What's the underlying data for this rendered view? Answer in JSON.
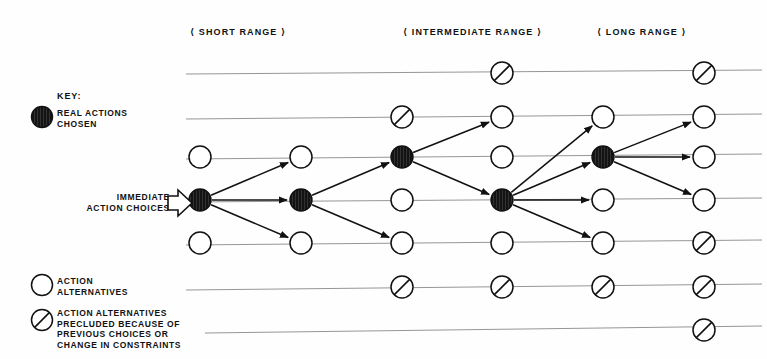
{
  "diagram": {
    "headers": [
      {
        "label": "SHORT RANGE",
        "x": 255,
        "y": 27
      },
      {
        "label": "INTERMEDIATE RANGE",
        "x": 465,
        "y": 27
      },
      {
        "label": "LONG RANGE",
        "x": 650,
        "y": 27
      }
    ],
    "key": {
      "title": "KEY:",
      "entries": [
        {
          "symbol": "filled-node",
          "text": "REAL ACTIONS\nCHOSEN"
        },
        {
          "symbol": "open-node",
          "text": "ACTION\nALTERNATIVES"
        },
        {
          "symbol": "precluded-node",
          "text": "ACTION ALTERNATIVES\nPRECLUDED BECAUSE OF\nPREVIOUS CHOICES OR\nCHANGE IN CONSTRAINTS"
        }
      ]
    },
    "immediate_label": "IMMEDIATE\nACTION CHOICES",
    "colors": {
      "ink": "#111111",
      "rule": "#8a8a8a",
      "paper": "#fefefe"
    },
    "columns": [
      200,
      301,
      402,
      502,
      603,
      704
    ],
    "rows": [
      73,
      117,
      157,
      200,
      243,
      287,
      330
    ],
    "rules": [
      {
        "x1": 186,
        "y1": 74,
        "x2": 762,
        "y2": 70
      },
      {
        "x1": 186,
        "y1": 119,
        "x2": 762,
        "y2": 114
      },
      {
        "x1": 186,
        "y1": 159,
        "x2": 762,
        "y2": 154
      },
      {
        "x1": 186,
        "y1": 202,
        "x2": 762,
        "y2": 198
      },
      {
        "x1": 186,
        "y1": 245,
        "x2": 762,
        "y2": 240
      },
      {
        "x1": 186,
        "y1": 290,
        "x2": 762,
        "y2": 284
      },
      {
        "x1": 205,
        "y1": 333,
        "x2": 762,
        "y2": 326
      }
    ],
    "nodes": [
      {
        "id": "c4r1",
        "col": 4,
        "row": 1,
        "type": "precluded"
      },
      {
        "id": "c6r1",
        "col": 6,
        "row": 1,
        "type": "precluded"
      },
      {
        "id": "c3r2",
        "col": 3,
        "row": 2,
        "type": "precluded"
      },
      {
        "id": "c4r2",
        "col": 4,
        "row": 2,
        "type": "open"
      },
      {
        "id": "c5r2",
        "col": 5,
        "row": 2,
        "type": "open"
      },
      {
        "id": "c6r2",
        "col": 6,
        "row": 2,
        "type": "open"
      },
      {
        "id": "c1r3",
        "col": 1,
        "row": 3,
        "type": "open"
      },
      {
        "id": "c2r3",
        "col": 2,
        "row": 3,
        "type": "open"
      },
      {
        "id": "c3r3",
        "col": 3,
        "row": 3,
        "type": "filled"
      },
      {
        "id": "c4r3",
        "col": 4,
        "row": 3,
        "type": "open"
      },
      {
        "id": "c5r3",
        "col": 5,
        "row": 3,
        "type": "filled"
      },
      {
        "id": "c6r3",
        "col": 6,
        "row": 3,
        "type": "open"
      },
      {
        "id": "c1r4",
        "col": 1,
        "row": 4,
        "type": "filled"
      },
      {
        "id": "c2r4",
        "col": 2,
        "row": 4,
        "type": "filled"
      },
      {
        "id": "c3r4",
        "col": 3,
        "row": 4,
        "type": "open"
      },
      {
        "id": "c4r4",
        "col": 4,
        "row": 4,
        "type": "filled"
      },
      {
        "id": "c5r4",
        "col": 5,
        "row": 4,
        "type": "open"
      },
      {
        "id": "c6r4",
        "col": 6,
        "row": 4,
        "type": "open"
      },
      {
        "id": "c1r5",
        "col": 1,
        "row": 5,
        "type": "open"
      },
      {
        "id": "c2r5",
        "col": 2,
        "row": 5,
        "type": "open"
      },
      {
        "id": "c3r5",
        "col": 3,
        "row": 5,
        "type": "open"
      },
      {
        "id": "c4r5",
        "col": 4,
        "row": 5,
        "type": "open"
      },
      {
        "id": "c5r5",
        "col": 5,
        "row": 5,
        "type": "open"
      },
      {
        "id": "c6r5",
        "col": 6,
        "row": 5,
        "type": "precluded"
      },
      {
        "id": "c3r6",
        "col": 3,
        "row": 6,
        "type": "precluded"
      },
      {
        "id": "c4r6",
        "col": 4,
        "row": 6,
        "type": "precluded"
      },
      {
        "id": "c5r6",
        "col": 5,
        "row": 6,
        "type": "precluded"
      },
      {
        "id": "c6r6",
        "col": 6,
        "row": 6,
        "type": "precluded"
      },
      {
        "id": "c6r7",
        "col": 6,
        "row": 7,
        "type": "precluded"
      }
    ],
    "arrows": [
      {
        "from": "c1r4",
        "to": "c2r3"
      },
      {
        "from": "c1r4",
        "to": "c2r4"
      },
      {
        "from": "c1r4",
        "to": "c2r5"
      },
      {
        "from": "c2r4",
        "to": "c3r3"
      },
      {
        "from": "c2r4",
        "to": "c3r5"
      },
      {
        "from": "c3r3",
        "to": "c4r2"
      },
      {
        "from": "c3r3",
        "to": "c4r4"
      },
      {
        "from": "c4r4",
        "to": "c5r2"
      },
      {
        "from": "c4r4",
        "to": "c5r3"
      },
      {
        "from": "c4r4",
        "to": "c5r4"
      },
      {
        "from": "c4r4",
        "to": "c5r5"
      },
      {
        "from": "c5r3",
        "to": "c6r2"
      },
      {
        "from": "c5r3",
        "to": "c6r3"
      },
      {
        "from": "c5r3",
        "to": "c6r4"
      }
    ],
    "radius": 11
  }
}
